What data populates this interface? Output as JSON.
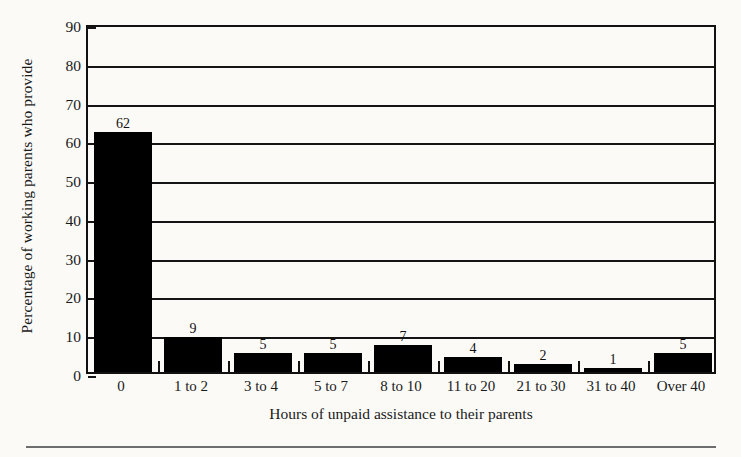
{
  "chart_data": {
    "type": "bar",
    "title": "",
    "subtitle": "",
    "xlabel": "Hours of unpaid assistance to their parents",
    "ylabel": "Percentage of working parents who provide",
    "categories": [
      "0",
      "1 to 2",
      "3 to 4",
      "5 to 7",
      "8 to 10",
      "11 to 20",
      "21 to 30",
      "31 to 40",
      "Over 40"
    ],
    "values": [
      62,
      9,
      5,
      5,
      7,
      4,
      2,
      1,
      5
    ],
    "value_labels": [
      "62",
      "9",
      "5",
      "5",
      "7",
      "4",
      "2",
      "1",
      "5"
    ],
    "ylim": [
      0,
      90
    ],
    "ytick_values": [
      0,
      10,
      20,
      30,
      40,
      50,
      60,
      70,
      80,
      90
    ],
    "ytick_labels": [
      "0",
      "10",
      "20",
      "30",
      "40",
      "50",
      "60",
      "70",
      "80",
      "90"
    ],
    "grid": "horizontal",
    "legend": "none",
    "bar_color": "#000000",
    "axis_color": "#111111",
    "background_color": "#fbfaf7"
  }
}
